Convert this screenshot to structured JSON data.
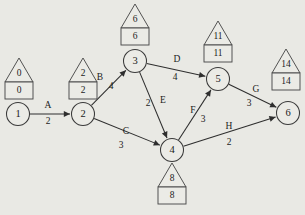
{
  "diagram": {
    "type": "aoa-network",
    "background_color": "#e9e9e4",
    "line_color": "#2e2e2e",
    "node_fill": "#ebebe6",
    "nodes": [
      {
        "id": "1",
        "label": "1",
        "cx": 18,
        "cy": 114,
        "r": 11.5,
        "house": {
          "early": "0",
          "late": "0",
          "box_x": 5,
          "box_y": 82,
          "box_w": 28,
          "box_h": 17,
          "tri_h": 24
        }
      },
      {
        "id": "2",
        "label": "2",
        "cx": 83,
        "cy": 114,
        "r": 11.5,
        "house": {
          "early": "2",
          "late": "2",
          "box_x": 69,
          "box_y": 82,
          "box_w": 28,
          "box_h": 17,
          "tri_h": 24
        }
      },
      {
        "id": "3",
        "label": "3",
        "cx": 135,
        "cy": 61,
        "r": 11.5,
        "house": {
          "early": "6",
          "late": "6",
          "box_x": 121,
          "box_y": 28,
          "box_w": 28,
          "box_h": 17,
          "tri_h": 24
        }
      },
      {
        "id": "4",
        "label": "4",
        "cx": 172,
        "cy": 150,
        "r": 11.5,
        "house": {
          "early": "8",
          "late": "8",
          "box_x": 158,
          "box_y": 187,
          "box_w": 28,
          "box_h": 17,
          "tri_h": 24,
          "below": true
        }
      },
      {
        "id": "5",
        "label": "5",
        "cx": 218,
        "cy": 79,
        "r": 11.5,
        "house": {
          "early": "11",
          "late": "11",
          "box_x": 204,
          "box_y": 45,
          "box_w": 28,
          "box_h": 17,
          "tri_h": 24
        }
      },
      {
        "id": "6",
        "label": "6",
        "cx": 288,
        "cy": 113,
        "r": 11.5,
        "house": {
          "early": "14",
          "late": "14",
          "box_x": 272,
          "box_y": 73,
          "box_w": 28,
          "box_h": 17,
          "tri_h": 24
        }
      }
    ],
    "edges": [
      {
        "name": "A",
        "duration": "2",
        "from": "1",
        "to": "2",
        "name_x": 48,
        "name_y": 106,
        "dur_x": 48,
        "dur_y": 122
      },
      {
        "name": "B",
        "duration": "4",
        "from": "2",
        "to": "3",
        "name_x": 100,
        "name_y": 78,
        "dur_x": 111,
        "dur_y": 87
      },
      {
        "name": "C",
        "duration": "3",
        "from": "2",
        "to": "4",
        "name_x": 126,
        "name_y": 132,
        "dur_x": 121,
        "dur_y": 146
      },
      {
        "name": "D",
        "duration": "4",
        "from": "3",
        "to": "5",
        "name_x": 177,
        "name_y": 60,
        "dur_x": 175,
        "dur_y": 78
      },
      {
        "name": "E",
        "duration": "2",
        "from": "3",
        "to": "4",
        "name_x": 163,
        "name_y": 101,
        "dur_x": 148,
        "dur_y": 104
      },
      {
        "name": "F",
        "duration": "3",
        "from": "4",
        "to": "5",
        "name_x": 193,
        "name_y": 111,
        "dur_x": 203,
        "dur_y": 120
      },
      {
        "name": "G",
        "duration": "3",
        "from": "5",
        "to": "6",
        "name_x": 256,
        "name_y": 90,
        "dur_x": 249,
        "dur_y": 104
      },
      {
        "name": "H",
        "duration": "2",
        "from": "4",
        "to": "6",
        "name_x": 229,
        "name_y": 127,
        "dur_x": 229,
        "dur_y": 143
      }
    ],
    "legend": {
      "house_top_meaning": "earliest event time",
      "house_bottom_meaning": "latest event time"
    }
  }
}
